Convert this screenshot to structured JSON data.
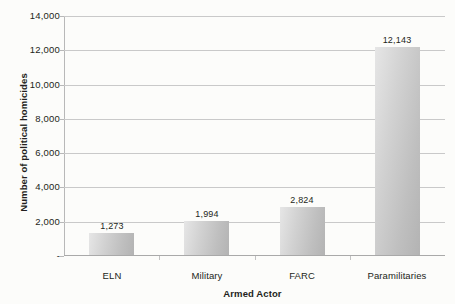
{
  "chart_data": {
    "type": "bar",
    "title": "",
    "categories": [
      "ELN",
      "Military",
      "FARC",
      "Paramilitaries"
    ],
    "values": [
      1273,
      1994,
      2824,
      12143
    ],
    "value_labels": [
      "1,273",
      "1,994",
      "2,824",
      "12,143"
    ],
    "xlabel": "Armed Actor",
    "ylabel": "Number of political homicides",
    "ylim": [
      0,
      14000
    ],
    "ytick_values": [
      0,
      2000,
      4000,
      6000,
      8000,
      10000,
      12000,
      14000
    ],
    "ytick_labels": [
      "-",
      "2,000",
      "4,000",
      "6,000",
      "8,000",
      "10,000",
      "12,000",
      "14,000"
    ],
    "grid": true,
    "legend": false,
    "bar_color": "#c8c8c8",
    "gridline_color": "#c9c9c9",
    "text_color": "#231f20",
    "background_color": "#fcfcfa"
  }
}
